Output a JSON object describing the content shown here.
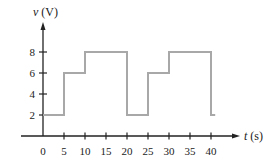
{
  "chart_data": {
    "type": "line",
    "subtype": "step",
    "title": "",
    "xlabel_var": "t",
    "xlabel_unit": "(s)",
    "ylabel_var": "v",
    "ylabel_unit": "(V)",
    "xlabel": "t (s)",
    "ylabel": "v (V)",
    "xlim": [
      0,
      42
    ],
    "ylim": [
      0,
      10
    ],
    "xticks": [
      0,
      5,
      10,
      15,
      20,
      25,
      30,
      35,
      40
    ],
    "xtick_labels": [
      "0",
      "5",
      "10",
      "15",
      "20",
      "25",
      "30",
      "35",
      "40"
    ],
    "yticks": [
      2,
      4,
      6,
      8
    ],
    "ytick_labels": [
      "2",
      "4",
      "6",
      "8"
    ],
    "grid": false,
    "legend": null,
    "series": [
      {
        "name": "v(t)",
        "color": "#a8a8a8",
        "points": [
          [
            0,
            2
          ],
          [
            5,
            2
          ],
          [
            5,
            6
          ],
          [
            10,
            6
          ],
          [
            10,
            8
          ],
          [
            20,
            8
          ],
          [
            20,
            2
          ],
          [
            25,
            2
          ],
          [
            25,
            6
          ],
          [
            30,
            6
          ],
          [
            30,
            8
          ],
          [
            40,
            8
          ],
          [
            40,
            2
          ],
          [
            41,
            2
          ]
        ]
      }
    ],
    "axis_color": "#222222"
  }
}
